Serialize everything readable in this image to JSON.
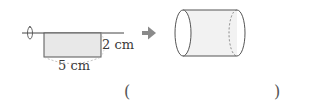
{
  "figure": {
    "height_label": "2 cm",
    "width_label": "5 cm",
    "arrow_color": "#8a8a8a",
    "rect_fill": "#e8e8e8"
  },
  "answer": {
    "open_paren": "(",
    "close_paren": ")",
    "value": ""
  }
}
